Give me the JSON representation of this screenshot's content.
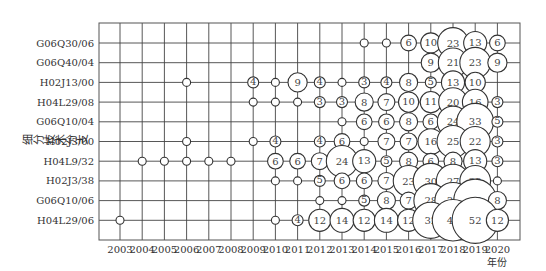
{
  "chart_data": {
    "type": "scatter",
    "subtype": "bubble",
    "title": "",
    "xlabel": "年份",
    "ylabel": "细分技术分支",
    "x": [
      "2003",
      "2004",
      "2005",
      "2006",
      "2007",
      "2008",
      "2009",
      "2010",
      "2011",
      "2012",
      "2013",
      "2014",
      "2015",
      "2016",
      "2017",
      "2018",
      "2019",
      "2020"
    ],
    "categories": [
      "G06Q30/06",
      "G06Q40/04",
      "H02J13/00",
      "H04L29/08",
      "G06Q10/04",
      "H02J3/00",
      "H04L9/32",
      "H02J3/38",
      "G06Q10/06",
      "H04L29/06"
    ],
    "grid": true,
    "legend": null,
    "series": [
      {
        "name": "G06Q30/06",
        "values": {
          "2014": 1,
          "2015": 2,
          "2016": 6,
          "2017": 10,
          "2018": 23,
          "2019": 13,
          "2020": 6
        }
      },
      {
        "name": "G06Q40/04",
        "values": {
          "2017": 9,
          "2018": 21,
          "2019": 23,
          "2020": 9
        }
      },
      {
        "name": "H02J13/00",
        "values": {
          "2006": 1,
          "2009": 4,
          "2010": 1,
          "2011": 9,
          "2012": 4,
          "2013": 2,
          "2014": 3,
          "2015": 4,
          "2016": 8,
          "2017": 5,
          "2018": 13,
          "2019": 10
        }
      },
      {
        "name": "H04L29/08",
        "values": {
          "2009": 1,
          "2010": 2,
          "2011": 1,
          "2012": 3,
          "2013": 3,
          "2014": 8,
          "2015": 7,
          "2016": 10,
          "2017": 11,
          "2018": 20,
          "2019": 16,
          "2020": 3
        }
      },
      {
        "name": "G06Q10/04",
        "values": {
          "2013": 1,
          "2014": 6,
          "2015": 6,
          "2016": 8,
          "2017": 6,
          "2018": 24,
          "2019": 33,
          "2020": 5
        }
      },
      {
        "name": "H02J3/00",
        "values": {
          "2006": 1,
          "2009": 2,
          "2010": 4,
          "2012": 4,
          "2013": 6,
          "2014": 2,
          "2015": 7,
          "2016": 7,
          "2017": 16,
          "2018": 25,
          "2019": 22,
          "2020": 3
        }
      },
      {
        "name": "H04L9/32",
        "values": {
          "2004": 1,
          "2005": 2,
          "2006": 1,
          "2007": 2,
          "2008": 1,
          "2010": 6,
          "2011": 6,
          "2012": 7,
          "2013": 24,
          "2014": 13,
          "2015": 5,
          "2016": 8,
          "2017": 6,
          "2018": 8,
          "2019": 13,
          "2020": 3
        }
      },
      {
        "name": "H02J3/38",
        "values": {
          "2010": 1,
          "2011": 1,
          "2012": 5,
          "2013": 6,
          "2014": 6,
          "2015": 7,
          "2016": 23,
          "2017": 30,
          "2018": 27,
          "2019": 23,
          "2020": 2
        }
      },
      {
        "name": "G06Q10/06",
        "values": {
          "2012": 1,
          "2013": 2,
          "2014": 5,
          "2015": 8,
          "2016": 7,
          "2017": 28,
          "2018": 32,
          "2019": 45,
          "2020": 8
        }
      },
      {
        "name": "H04L29/06",
        "values": {
          "2003": 1,
          "2010": 2,
          "2011": 4,
          "2012": 12,
          "2013": 14,
          "2014": 12,
          "2015": 14,
          "2016": 12,
          "2017": 32,
          "2018": 42,
          "2019": 52,
          "2020": 12
        }
      }
    ]
  }
}
